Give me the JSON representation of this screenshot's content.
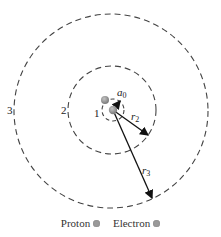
{
  "diagram": {
    "type": "bohr-model-orbits",
    "colors": {
      "orbit": "#444444",
      "arrow": "#111111",
      "particle": "#9a9a9a"
    },
    "orbits": [
      {
        "label": "1",
        "radius_label": "a0",
        "radius_sub": "0"
      },
      {
        "label": "2",
        "radius_label": "r",
        "radius_sub": "2"
      },
      {
        "label": "3",
        "radius_label": "r",
        "radius_sub": "3"
      }
    ]
  },
  "labels": {
    "orbit1": "1",
    "orbit2": "2",
    "orbit3": "3",
    "a": "a",
    "a_sub": "0",
    "r": "r",
    "r2_sub": "2",
    "r3_sub": "3"
  },
  "legend": {
    "proton": "Proton",
    "electron": "Electron"
  }
}
